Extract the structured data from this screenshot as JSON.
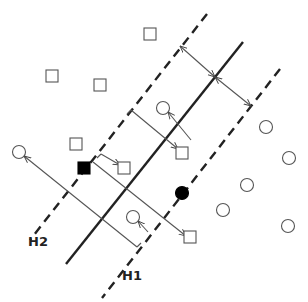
{
  "diagram": {
    "type": "svm-margin-illustration",
    "colors": {
      "stroke": "#222222",
      "thin": "#555555",
      "shape": "#555555",
      "fill_dark": "#000000",
      "background": "#ffffff"
    },
    "lines": {
      "hyperplane": {
        "name": "H",
        "style": "solid",
        "from": [
          243,
          42
        ],
        "to": [
          66,
          264
        ]
      },
      "H2": {
        "name": "H2",
        "style": "dashed",
        "from": [
          207,
          14
        ],
        "to": [
          30,
          240
        ]
      },
      "H1": {
        "name": "H1",
        "style": "dashed",
        "from": [
          280,
          69
        ],
        "to": [
          102,
          298
        ]
      }
    },
    "labels": {
      "H2": {
        "text": "H2",
        "x": 28,
        "y": 234
      },
      "H1": {
        "text": "H1",
        "x": 122,
        "y": 268
      }
    },
    "squares": [
      {
        "x": 150,
        "y": 34,
        "filled": false
      },
      {
        "x": 52,
        "y": 76,
        "filled": false
      },
      {
        "x": 100,
        "y": 85,
        "filled": false
      },
      {
        "x": 76,
        "y": 144,
        "filled": false
      },
      {
        "x": 124,
        "y": 168,
        "filled": false
      },
      {
        "x": 182,
        "y": 153,
        "filled": false
      },
      {
        "x": 190,
        "y": 237,
        "filled": false
      },
      {
        "x": 84,
        "y": 168,
        "filled": true
      }
    ],
    "circles": [
      {
        "x": 19,
        "y": 152,
        "filled": false
      },
      {
        "x": 163,
        "y": 108,
        "filled": false
      },
      {
        "x": 266,
        "y": 127,
        "filled": false
      },
      {
        "x": 289,
        "y": 158,
        "filled": false
      },
      {
        "x": 247,
        "y": 185,
        "filled": false
      },
      {
        "x": 223,
        "y": 210,
        "filled": false
      },
      {
        "x": 288,
        "y": 226,
        "filled": false
      },
      {
        "x": 133,
        "y": 217,
        "filled": false
      },
      {
        "x": 182,
        "y": 193,
        "filled": true
      }
    ],
    "arrows": [
      {
        "from": [
          180,
          46
        ],
        "to": [
          215,
          77
        ],
        "heads": "both"
      },
      {
        "from": [
          215,
          77
        ],
        "to": [
          251,
          106
        ],
        "heads": "both"
      },
      {
        "from": [
          131,
          110
        ],
        "to": [
          178,
          149
        ],
        "heads": "end"
      },
      {
        "from": [
          101,
          154
        ],
        "to": [
          120,
          165
        ],
        "heads": "end"
      },
      {
        "from": [
          191,
          140
        ],
        "to": [
          168,
          112
        ],
        "heads": "end"
      },
      {
        "from": [
          93,
          162
        ],
        "to": [
          186,
          236
        ],
        "heads": "end"
      },
      {
        "from": [
          137,
          247
        ],
        "to": [
          24,
          156
        ],
        "heads": "end"
      },
      {
        "from": [
          148,
          232
        ],
        "to": [
          138,
          221
        ],
        "heads": "end"
      }
    ],
    "ticks": [
      {
        "from": [
          131,
          110
        ],
        "to": [
          127,
          114
        ]
      },
      {
        "from": [
          101,
          154
        ],
        "to": [
          97,
          158
        ]
      },
      {
        "from": [
          137,
          247
        ],
        "to": [
          141,
          243
        ]
      }
    ]
  }
}
